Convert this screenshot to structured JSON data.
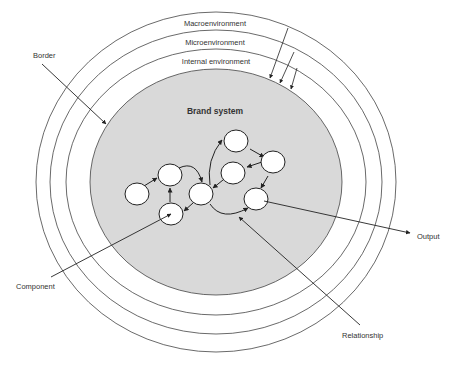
{
  "diagram": {
    "type": "concentric-system-diagram",
    "rings": [
      {
        "label": "Macroenvironment"
      },
      {
        "label": "Microenvironment"
      },
      {
        "label": "Internal environment"
      }
    ],
    "core": {
      "label": "Brand system",
      "fill": "#d9d9d9"
    },
    "callouts": {
      "border": "Border",
      "component": "Component",
      "relationship": "Relationship",
      "output": "Output"
    },
    "component_count": 8,
    "colors": {
      "line": "#333333",
      "core_fill": "#d9d9d9",
      "node_fill": "#ffffff"
    }
  }
}
